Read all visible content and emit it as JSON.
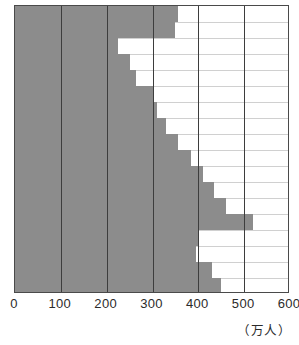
{
  "chart_data": {
    "type": "bar",
    "orientation": "horizontal",
    "title": "",
    "subtitle": "",
    "xlabel": "",
    "ylabel": "",
    "unit_label": "（万人）",
    "xlim": [
      0,
      600
    ],
    "xticks": [
      0,
      100,
      200,
      300,
      400,
      500,
      600
    ],
    "xtick_labels": [
      "0",
      "100",
      "200",
      "300",
      "400",
      "500",
      "600"
    ],
    "grid": true,
    "grid_axis": "x",
    "legend": null,
    "bar_color": "#8c8c8c",
    "frame_color": "#4a4a4a",
    "gridline_color": "#3d3d3d",
    "categories": [
      "row-1",
      "row-2",
      "row-3",
      "row-4",
      "row-5",
      "row-6",
      "row-7",
      "row-8",
      "row-9",
      "row-10",
      "row-11",
      "row-12",
      "row-13",
      "row-14",
      "row-15",
      "row-16",
      "row-17",
      "row-18"
    ],
    "values": [
      355,
      350,
      225,
      250,
      265,
      300,
      310,
      330,
      355,
      385,
      410,
      435,
      460,
      520,
      400,
      395,
      430,
      450
    ]
  }
}
